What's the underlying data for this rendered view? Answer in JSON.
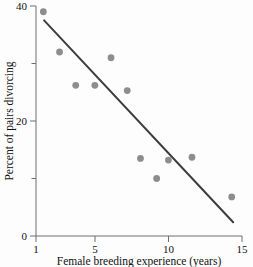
{
  "chart_data": {
    "type": "scatter",
    "title": "",
    "xlabel": "Female breeding experience (years)",
    "ylabel": "Percent of pairs divorcing",
    "xlim": [
      1,
      15
    ],
    "ylim": [
      0,
      40
    ],
    "xticks": [
      1,
      5,
      10,
      15
    ],
    "xtick_labels": [
      "1",
      "5",
      "10",
      "15"
    ],
    "yticks": [
      0,
      20,
      40
    ],
    "ytick_labels": [
      "0",
      "20",
      "40"
    ],
    "yminorticks": [
      10,
      30
    ],
    "grid": false,
    "legend": false,
    "marker_color": "#8d8d8d",
    "line_color": "#3c3c3c",
    "axis_color": "#6e6e6e",
    "points": [
      {
        "x": 1.5,
        "y": 39.0
      },
      {
        "x": 2.6,
        "y": 32.0
      },
      {
        "x": 3.7,
        "y": 26.2
      },
      {
        "x": 5.0,
        "y": 26.2
      },
      {
        "x": 6.1,
        "y": 31.0
      },
      {
        "x": 7.2,
        "y": 25.3
      },
      {
        "x": 8.1,
        "y": 13.5
      },
      {
        "x": 9.2,
        "y": 10.0
      },
      {
        "x": 10.0,
        "y": 13.2
      },
      {
        "x": 11.6,
        "y": 13.7
      },
      {
        "x": 14.3,
        "y": 6.8
      }
    ],
    "trend_line": {
      "x_start": 1.55,
      "y_start": 37.5,
      "x_end": 14.4,
      "y_end": 2.4
    }
  },
  "axes": {
    "x_title": "Female breeding experience (years)",
    "y_title": "Percent of pairs divorcing",
    "x_tick_1": "1",
    "x_tick_2": "5",
    "x_tick_3": "10",
    "x_tick_4": "15",
    "y_tick_1": "0",
    "y_tick_2": "20",
    "y_tick_3": "40"
  }
}
